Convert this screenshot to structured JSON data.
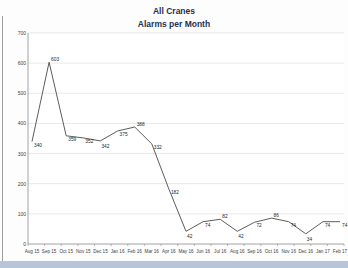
{
  "window": {
    "bottom_strip_color": "#b7c5d8",
    "left_border_color": "#9c9c9c"
  },
  "chart_data": {
    "type": "line",
    "title": "All Cranes",
    "subtitle": "Alarms per Month",
    "categories": [
      "Aug 15",
      "Sep 15",
      "Oct 15",
      "Nov 15",
      "Dec 15",
      "Jan 16",
      "Feb 16",
      "Mar 16",
      "Apr 16",
      "May 16",
      "Jun 16",
      "Jul 16",
      "Aug 16",
      "Sep 16",
      "Oct 16",
      "Nov 16",
      "Dec 16",
      "Jan 17",
      "Feb 17"
    ],
    "values": [
      340,
      603,
      359,
      352,
      342,
      375,
      388,
      332,
      182,
      42,
      74,
      82,
      42,
      72,
      86,
      74,
      34,
      74,
      74
    ],
    "data_labels_visible": true,
    "xlabel": "",
    "ylabel": "",
    "ylim": [
      0,
      700
    ],
    "ytick_interval": 100,
    "yticks": [
      0,
      100,
      200,
      300,
      400,
      500,
      600,
      700
    ],
    "grid": "horizontal",
    "legend": "none",
    "colors": {
      "title_text": "#1f3250",
      "line": "#4a4a4a",
      "gridline": "#d9d9d9",
      "axis_line": "#8c8c8c",
      "tick_text": "#3f3f3f",
      "data_label_text": "#262626",
      "plot_background": "#ffffff"
    }
  }
}
